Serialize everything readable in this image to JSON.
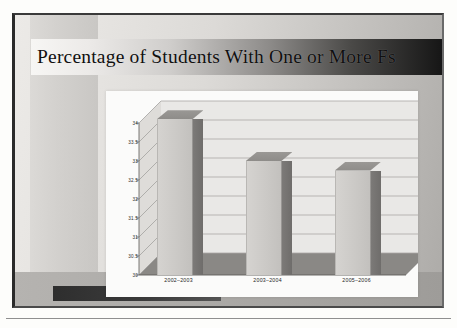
{
  "slide": {
    "title": "Percentage of Students With One or More Fs",
    "banner_gradient_from": "#f7f6f4",
    "banner_gradient_to": "#161616"
  },
  "chart_data": {
    "type": "bar",
    "title": "Percentage of Students With One or More Fs",
    "xlabel": "",
    "ylabel": "",
    "categories": [
      "2002–2003",
      "2003–2004",
      "2005–2006"
    ],
    "values": [
      34.1,
      33.0,
      32.75
    ],
    "ylim": [
      30,
      34
    ],
    "ytick_labels": [
      "34",
      "33.5",
      "33",
      "32.5",
      "32",
      "31.5",
      "31",
      "30.5",
      "30"
    ],
    "ytick_values": [
      34,
      33.5,
      33,
      32.5,
      32,
      31.5,
      31,
      30.5,
      30
    ],
    "grid": true,
    "legend": false,
    "three_d": true,
    "bar_face_color": "#cbc9c6",
    "bar_side_color": "#6f6d6b",
    "bar_top_color": "#8e8c89",
    "plot_background": "#fbfbfa",
    "floor_color": "#8a8885"
  },
  "decor": {
    "left_band": "left-vertical-gray-band",
    "bottom_bar": "bottom-dark-accent-bar",
    "page_rule": "horizontal-rule"
  }
}
